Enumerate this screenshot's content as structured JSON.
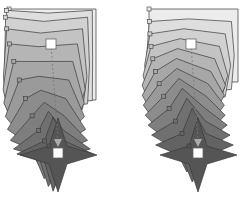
{
  "diagram": {
    "width": 246,
    "height": 205,
    "background": "#ffffff",
    "stroke_color": "#3a3a3a",
    "fill_start": "#ececec",
    "fill_end": "#555555",
    "handle_fill": "#ffffff",
    "handle_stroke": "#666666",
    "arrow_fill": "#aaaaaa",
    "steps": 12,
    "figures": [
      {
        "id": "left-morph",
        "description": "square morphing into four-point star (curved path interpolation)",
        "square": {
          "x0": 9,
          "y0": 9,
          "x1": 96,
          "y1": 100
        },
        "star": {
          "cx": 58,
          "cy": 155,
          "arm_left": 20,
          "arm_right": 97,
          "top": 118,
          "bottom": 192,
          "inner": 9
        },
        "drift": -18,
        "start_handle": {
          "x": 51,
          "y": 44
        },
        "end_handle": {
          "x": 58,
          "y": 153
        },
        "curved": true
      },
      {
        "id": "right-morph",
        "description": "square morphing into four-point star (linear path interpolation)",
        "square": {
          "x0": 149,
          "y0": 9,
          "x1": 238,
          "y1": 82
        },
        "star": {
          "cx": 198,
          "cy": 155,
          "arm_left": 160,
          "arm_right": 237,
          "top": 118,
          "bottom": 192,
          "inner": 9
        },
        "drift": -20,
        "start_handle": {
          "x": 191,
          "y": 44
        },
        "end_handle": {
          "x": 198,
          "y": 153
        },
        "curved": false
      }
    ]
  }
}
